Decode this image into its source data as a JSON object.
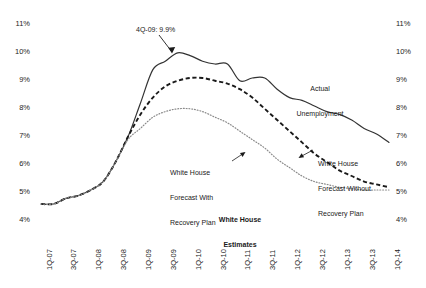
{
  "chart_data": {
    "type": "line",
    "title": "",
    "subtitle": "",
    "xlabel": "",
    "ylabel": "",
    "ylim": [
      4,
      11
    ],
    "yticks": [
      "4%",
      "5%",
      "6%",
      "7%",
      "8%",
      "9%",
      "10%",
      "11%"
    ],
    "ytick_values": [
      4,
      5,
      6,
      7,
      8,
      9,
      10,
      11
    ],
    "grid": false,
    "legend_position": "inline-annotations",
    "categories": [
      "1Q-07",
      "2Q-07",
      "3Q-07",
      "4Q-07",
      "1Q-08",
      "2Q-08",
      "3Q-08",
      "4Q-08",
      "1Q-09",
      "2Q-09",
      "3Q-09",
      "4Q-09",
      "1Q-10",
      "2Q-10",
      "3Q-10",
      "4Q-10",
      "1Q-11",
      "2Q-11",
      "3Q-11",
      "4Q-11",
      "1Q-12",
      "2Q-12",
      "3Q-12",
      "4Q-12",
      "1Q-13",
      "2Q-13",
      "3Q-13",
      "4Q-13",
      "1Q-14"
    ],
    "xticks": [
      "1Q-07",
      "3Q-07",
      "1Q-08",
      "3Q-08",
      "1Q-09",
      "3Q-09",
      "1Q-10",
      "3Q-10",
      "1Q-11",
      "3Q-11",
      "1Q-12",
      "3Q-12",
      "1Q-13",
      "3Q-13",
      "1Q-14"
    ],
    "series": [
      {
        "name": "Actual Unemployment",
        "style": "solid",
        "color": "#333333",
        "values": [
          4.5,
          4.5,
          4.7,
          4.8,
          5.0,
          5.3,
          6.0,
          6.9,
          8.1,
          9.3,
          9.6,
          9.9,
          9.8,
          9.6,
          9.5,
          9.5,
          8.9,
          9.0,
          9.0,
          8.6,
          8.3,
          8.2,
          8.0,
          7.8,
          7.7,
          7.5,
          7.2,
          7.0,
          6.7
        ]
      },
      {
        "name": "White House Forecast Without Recovery Plan",
        "style": "dashed",
        "color": "#1a1a1a",
        "values": [
          4.5,
          4.5,
          4.7,
          4.8,
          5.0,
          5.3,
          6.0,
          6.9,
          7.7,
          8.3,
          8.7,
          8.9,
          9.0,
          9.0,
          8.9,
          8.8,
          8.6,
          8.3,
          7.9,
          7.5,
          7.1,
          6.7,
          6.3,
          6.0,
          5.7,
          5.5,
          5.3,
          5.2,
          5.1
        ]
      },
      {
        "name": "White House Forecast With Recovery Plan",
        "style": "dotted",
        "color": "#8a8a8a",
        "values": [
          4.5,
          4.5,
          4.7,
          4.8,
          5.0,
          5.3,
          6.0,
          6.8,
          7.2,
          7.6,
          7.8,
          7.9,
          7.9,
          7.8,
          7.6,
          7.4,
          7.1,
          6.8,
          6.5,
          6.1,
          5.8,
          5.5,
          5.3,
          5.2,
          5.1,
          5.05,
          5.0,
          5.0,
          5.0
        ]
      }
    ],
    "annotations": [
      {
        "name": "peak-callout",
        "text": "4Q-09: 9.9%",
        "points_to": {
          "category": "4Q-09",
          "value": 9.9
        }
      },
      {
        "name": "actual-unemployment-label",
        "text": "Actual\nUnemployment"
      },
      {
        "name": "forecast-with-recovery-label",
        "text": "White House\nForecast With\nRecovery Plan"
      },
      {
        "name": "forecast-without-recovery-label",
        "text": "White House\nForecast Without\nRecovery Plan"
      },
      {
        "name": "white-house-estimates-label",
        "text": "White House\nEstimates"
      }
    ]
  },
  "labels": {
    "peak_callout": "4Q-09: 9.9%",
    "actual_line1": "Actual",
    "actual_line2": "Unemployment",
    "with_recovery_line1": "White House",
    "with_recovery_line2": "Forecast With",
    "with_recovery_line3": "Recovery Plan",
    "without_recovery_line1": "White House",
    "without_recovery_line2": "Forecast Without",
    "without_recovery_line3": "Recovery Plan",
    "estimates_line1": "White House",
    "estimates_line2": "Estimates"
  },
  "axis": {
    "y_left": [
      "11%",
      "10%",
      "9%",
      "8%",
      "7%",
      "6%",
      "5%",
      "4%"
    ],
    "y_right": [
      "11%",
      "10%",
      "9%",
      "8%",
      "7%",
      "6%",
      "5%",
      "4%"
    ],
    "x": [
      "1Q-07",
      "3Q-07",
      "1Q-08",
      "3Q-08",
      "1Q-09",
      "3Q-09",
      "1Q-10",
      "3Q-10",
      "1Q-11",
      "3Q-11",
      "1Q-12",
      "3Q-12",
      "1Q-13",
      "3Q-13",
      "1Q-14"
    ]
  },
  "colors": {
    "actual": "#333333",
    "without_recovery": "#1a1a1a",
    "with_recovery": "#8a8a8a",
    "text": "#1a1a1a",
    "background": "#ffffff"
  }
}
